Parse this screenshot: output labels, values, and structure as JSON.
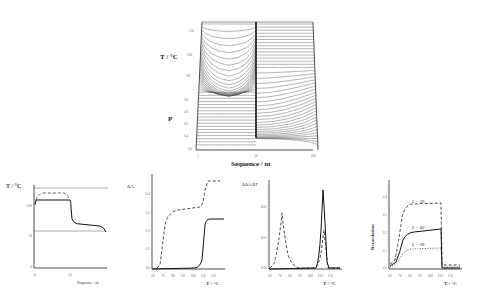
{
  "chart_data": [
    {
      "type": "line",
      "title": "",
      "description": "3D surface / waterfall of melting curves along sequence",
      "xlabel": "Sequence / nt",
      "ylabel_upper": "T / °C",
      "ylabel_lower": "P",
      "x_ticks": [
        "1",
        "50",
        "100"
      ],
      "t_ticks": [
        "60",
        "80",
        "100",
        "120"
      ],
      "p_ticks": [
        "0.0",
        "0.2",
        "0.4",
        "0.6",
        "0.8"
      ],
      "xlim": [
        1,
        100
      ],
      "tlim": [
        60,
        120
      ],
      "plim": [
        0,
        1
      ]
    },
    {
      "type": "line",
      "xlabel": "Sequence / nt",
      "ylabel": "T / °C",
      "x_ticks": [
        "0",
        "50",
        "100"
      ],
      "y_ticks": [
        "0",
        "50",
        "100"
      ],
      "series": [
        {
          "name": "solid",
          "x": [
            0,
            2,
            45,
            50,
            52,
            60,
            90,
            98,
            100
          ],
          "values": [
            96,
            112,
            112,
            110,
            78,
            74,
            70,
            66,
            62
          ]
        },
        {
          "name": "dashed",
          "x": [
            2,
            8,
            40,
            46
          ],
          "values": [
            112,
            120,
            120,
            113
          ]
        }
      ],
      "hlines": [
        135,
        62
      ]
    },
    {
      "type": "line",
      "xlabel": "T / °C",
      "ylabel": "ΔA",
      "x_ticks": [
        "60",
        "70",
        "80",
        "90",
        "100",
        "110",
        "120"
      ],
      "y_ticks": [
        "0.0",
        "0.1",
        "0.2",
        "0.3",
        "0.4",
        "0.5"
      ],
      "series": [
        {
          "name": "dashed",
          "x": [
            62,
            66,
            72,
            76,
            100,
            104,
            108,
            116
          ],
          "values": [
            0,
            0.02,
            0.28,
            0.32,
            0.34,
            0.38,
            0.5,
            0.5
          ]
        },
        {
          "name": "solid",
          "x": [
            60,
            100,
            105,
            108,
            110,
            120
          ],
          "values": [
            0,
            0.005,
            0.02,
            0.2,
            0.27,
            0.27
          ]
        }
      ]
    },
    {
      "type": "line",
      "xlabel": "T / °C",
      "ylabel": "ΔΔA/ΔT",
      "x_ticks": [
        "60",
        "70",
        "80",
        "90",
        "100",
        "110",
        "120"
      ],
      "y_ticks": [
        "0.00",
        "0.01",
        "0.02"
      ],
      "series": [
        {
          "name": "dashed",
          "x": [
            60,
            66,
            72,
            78,
            88,
            100,
            104,
            107,
            110,
            120
          ],
          "values": [
            0,
            0.004,
            0.019,
            0.003,
            0,
            0,
            0.002,
            0.013,
            0,
            0
          ]
        },
        {
          "name": "solid",
          "x": [
            60,
            100,
            104,
            107,
            110,
            120
          ],
          "values": [
            0,
            0,
            0.005,
            0.026,
            0,
            0
          ]
        }
      ]
    },
    {
      "type": "line",
      "xlabel": "T / °C",
      "ylabel": "Retardation",
      "x_ticks": [
        "60",
        "70",
        "80",
        "90",
        "100",
        "110",
        "120"
      ],
      "y_ticks": [
        "0.0",
        "0.1",
        "0.2",
        "0.3",
        "0.4"
      ],
      "series": [
        {
          "name": "L = 20",
          "style": "dashed",
          "x": [
            60,
            66,
            72,
            80,
            108,
            108.5,
            120
          ],
          "values": [
            0.02,
            0.1,
            0.3,
            0.36,
            0.36,
            0.04,
            0.04
          ]
        },
        {
          "name": "L = 60",
          "style": "solid",
          "x": [
            60,
            68,
            74,
            82,
            108,
            108.5,
            120
          ],
          "values": [
            0.01,
            0.05,
            0.18,
            0.21,
            0.22,
            0.01,
            0.01
          ]
        },
        {
          "name": "L = 90",
          "style": "dotted",
          "x": [
            60,
            68,
            76,
            108,
            108.5,
            120
          ],
          "values": [
            0.005,
            0.05,
            0.1,
            0.11,
            0.02,
            0.02
          ]
        }
      ]
    }
  ],
  "labels": {
    "top_t": "T / °C",
    "top_p": "P",
    "top_x": "Sequence / nt",
    "p1_y": "T / °C",
    "p1_x": "Sequence / nt",
    "p2_y": "ΔA",
    "p2_x": "T / °C",
    "p3_y": "ΔΔA/ΔT",
    "p3_x": "T / °C",
    "p4_y": "Retardation",
    "p4_x": "T / °C",
    "L20": "L = 20",
    "L60": "L = 60",
    "L90": "L = 90"
  }
}
